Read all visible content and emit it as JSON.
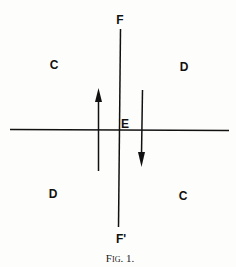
{
  "labels": {
    "top": "F",
    "bottom": "F'",
    "center": "E",
    "upper_left": "C",
    "upper_right": "D",
    "lower_left": "D",
    "lower_right": "C"
  },
  "caption": "Fig. 1.",
  "colors": {
    "ink": "#111111",
    "paper": "#fdfdfb"
  }
}
